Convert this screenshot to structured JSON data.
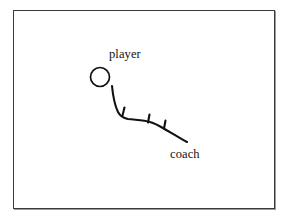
{
  "figure": {
    "type": "sketch-diagram",
    "background_color": "#ffffff",
    "ink_color": "#111111",
    "frame": {
      "name": "frame-border",
      "border_color": "#3a3a3a",
      "shadow_color": "#9a9a9a",
      "x": 13,
      "y": 10,
      "width": 262,
      "height": 199
    },
    "labels": [
      {
        "id": "player",
        "text": "player",
        "x": 109,
        "y": 48
      },
      {
        "id": "coach",
        "text": "coach",
        "x": 170,
        "y": 148
      }
    ],
    "shapes": {
      "ball": {
        "name": "player-circle",
        "cx": 100,
        "cy": 77,
        "r": 9.5,
        "stroke": "#111111",
        "stroke_width": 1.6,
        "fill": "none"
      },
      "path": {
        "name": "trajectory-path",
        "stroke": "#111111",
        "stroke_width": 2.1,
        "d": "M 112 86 C 113 96 114 104 118 112 C 120 116 123 118 128 119 C 136 120 144 120 150 122 C 157 124 161 127 168 131 C 175 135 181 139 187 142",
        "barbs": [
          {
            "name": "barb-1",
            "d": "M 122 115 L 124 107"
          },
          {
            "name": "barb-2",
            "d": "M 148 122 L 149 114"
          },
          {
            "name": "barb-3",
            "d": "M 164 128 L 165 120"
          }
        ]
      }
    }
  }
}
